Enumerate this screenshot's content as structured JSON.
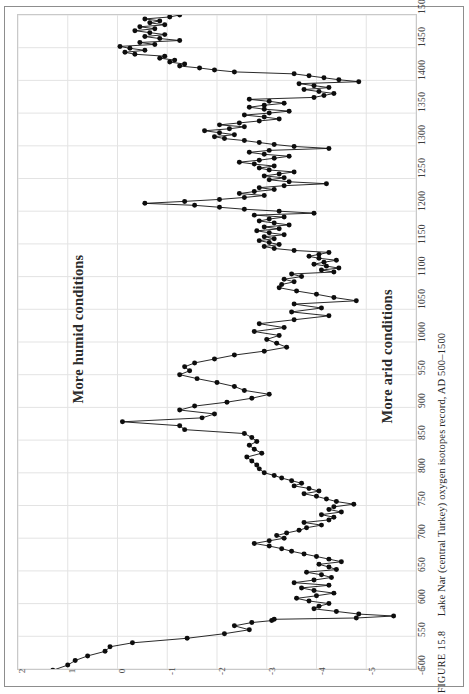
{
  "caption": {
    "number": "FIGURE 15.8",
    "text": "Lake Nar (central Turkey) oxygen isotopes record, AD 500–1500"
  },
  "annotations": {
    "humid": "More humid conditions",
    "arid": "More arid conditions"
  },
  "colors": {
    "line": "#111111",
    "marker": "#0d0d0d",
    "grid": "#e3e3e3",
    "plot_border": "#c9c9c9",
    "plate_border": "#8d8d8d",
    "tick_text": "#3c3c3c",
    "annotation_text": "#2b2b2b",
    "background": "#ffffff"
  },
  "chart_data": {
    "type": "line",
    "orientation": "rotated-90-ccw",
    "title": "Lake Nar (central Turkey) oxygen isotopes record, AD 500–1500",
    "xlabel": "AD",
    "ylabel": "δ18O",
    "grid": true,
    "legend": "none",
    "xlim": [
      500,
      1500
    ],
    "ylim": [
      2,
      -6
    ],
    "xticks": [
      500,
      550,
      600,
      650,
      700,
      750,
      800,
      850,
      900,
      950,
      1000,
      1050,
      1100,
      1150,
      1200,
      1250,
      1300,
      1350,
      1400,
      1450,
      1500
    ],
    "yticks": [
      -6,
      -5,
      -4,
      -3,
      -2,
      -1,
      0,
      1,
      2
    ],
    "ytick_labels": [
      "-6",
      "-5",
      "-4",
      "-3",
      "-2",
      "-1",
      "0",
      "1",
      "2"
    ],
    "annotations": [
      {
        "text": "More humid conditions",
        "near_value": -4.6
      },
      {
        "text": "More arid conditions",
        "near_value": 0.6
      }
    ],
    "series": [
      {
        "name": "Lake Nar δ18O",
        "marker": "filled-circle",
        "x": [
          498,
          506,
          513,
          520,
          527,
          534,
          540,
          547,
          554,
          560,
          566,
          571,
          574,
          576,
          578,
          581,
          584,
          588,
          592,
          596,
          600,
          604,
          608,
          612,
          616,
          620,
          624,
          628,
          632,
          636,
          640,
          644,
          648,
          652,
          656,
          660,
          664,
          668,
          672,
          676,
          680,
          684,
          688,
          692,
          696,
          700,
          704,
          708,
          712,
          716,
          720,
          724,
          728,
          732,
          736,
          740,
          744,
          748,
          752,
          756,
          760,
          764,
          768,
          772,
          776,
          780,
          784,
          788,
          792,
          796,
          800,
          806,
          812,
          818,
          824,
          830,
          836,
          842,
          848,
          854,
          860,
          866,
          872,
          878,
          884,
          890,
          896,
          902,
          908,
          914,
          920,
          926,
          932,
          938,
          944,
          950,
          956,
          962,
          968,
          974,
          980,
          986,
          992,
          998,
          1004,
          1010,
          1016,
          1022,
          1028,
          1034,
          1040,
          1046,
          1052,
          1058,
          1063,
          1068,
          1073,
          1078,
          1083,
          1088,
          1092,
          1096,
          1100,
          1104,
          1107,
          1110,
          1113,
          1116,
          1119,
          1122,
          1125,
          1128,
          1131,
          1134,
          1137,
          1140,
          1143,
          1146,
          1149,
          1152,
          1155,
          1158,
          1161,
          1164,
          1167,
          1170,
          1173,
          1176,
          1179,
          1182,
          1185,
          1188,
          1191,
          1194,
          1197,
          1200,
          1203,
          1206,
          1209,
          1212,
          1215,
          1218,
          1221,
          1224,
          1227,
          1230,
          1233,
          1236,
          1239,
          1242,
          1245,
          1248,
          1251,
          1254,
          1257,
          1260,
          1263,
          1266,
          1269,
          1272,
          1275,
          1278,
          1281,
          1284,
          1287,
          1290,
          1293,
          1296,
          1299,
          1302,
          1305,
          1308,
          1311,
          1314,
          1317,
          1320,
          1323,
          1326,
          1329,
          1332,
          1335,
          1338,
          1341,
          1344,
          1347,
          1350,
          1353,
          1356,
          1359,
          1362,
          1365,
          1368,
          1371,
          1374,
          1377,
          1380,
          1383,
          1386,
          1389,
          1392,
          1395,
          1398,
          1401,
          1404,
          1407,
          1410,
          1413,
          1416,
          1419,
          1422,
          1425,
          1428,
          1431,
          1434,
          1437,
          1440,
          1443,
          1446,
          1449,
          1452,
          1455,
          1458,
          1461,
          1464,
          1467,
          1470,
          1473,
          1476,
          1479,
          1482,
          1485,
          1488,
          1491,
          1494,
          1497,
          1500
        ],
        "y": [
          1.3,
          1.0,
          0.85,
          0.6,
          0.25,
          0.15,
          -0.3,
          -1.4,
          -2.15,
          -2.65,
          -2.35,
          -2.7,
          -3.1,
          -3.15,
          -4.8,
          -5.55,
          -4.85,
          -4.4,
          -3.95,
          -4.05,
          -4.25,
          -3.85,
          -3.6,
          -4.0,
          -4.35,
          -3.95,
          -3.7,
          -4.25,
          -3.55,
          -3.95,
          -4.3,
          -4.1,
          -3.8,
          -4.4,
          -4.25,
          -4.05,
          -4.5,
          -4.25,
          -4.0,
          -3.75,
          -3.5,
          -3.3,
          -3.05,
          -2.75,
          -3.05,
          -3.35,
          -3.2,
          -3.4,
          -3.65,
          -3.8,
          -4.1,
          -3.75,
          -4.25,
          -4.35,
          -4.1,
          -4.5,
          -4.25,
          -4.35,
          -4.75,
          -4.4,
          -4.2,
          -4.0,
          -3.75,
          -4.05,
          -3.85,
          -3.55,
          -3.7,
          -3.5,
          -3.3,
          -3.15,
          -2.95,
          -2.85,
          -2.8,
          -2.7,
          -2.6,
          -2.9,
          -2.75,
          -2.65,
          -2.8,
          -2.7,
          -2.55,
          -1.35,
          -1.25,
          -0.1,
          -1.7,
          -1.95,
          -1.25,
          -1.55,
          -2.2,
          -2.7,
          -3.05,
          -2.55,
          -2.35,
          -2.0,
          -1.6,
          -1.25,
          -1.45,
          -1.35,
          -1.55,
          -1.95,
          -2.35,
          -2.95,
          -3.4,
          -3.2,
          -3.0,
          -3.25,
          -2.75,
          -3.35,
          -2.85,
          -3.55,
          -4.25,
          -3.5,
          -4.1,
          -3.55,
          -4.8,
          -4.35,
          -4.0,
          -3.6,
          -3.25,
          -3.3,
          -3.55,
          -3.35,
          -3.7,
          -3.5,
          -4.35,
          -4.1,
          -4.45,
          -4.2,
          -3.95,
          -4.15,
          -4.4,
          -4.05,
          -3.85,
          -4.05,
          -4.25,
          -3.55,
          -3.15,
          -2.95,
          -3.25,
          -3.05,
          -2.85,
          -3.15,
          -2.95,
          -3.35,
          -3.05,
          -2.8,
          -3.25,
          -2.95,
          -3.45,
          -3.15,
          -2.85,
          -3.05,
          -3.35,
          -2.75,
          -3.95,
          -3.25,
          -2.55,
          -2.05,
          -1.55,
          -0.55,
          -1.35,
          -2.05,
          -2.55,
          -2.95,
          -2.45,
          -2.75,
          -3.15,
          -2.85,
          -3.35,
          -4.2,
          -3.45,
          -3.05,
          -3.35,
          -2.95,
          -3.25,
          -3.55,
          -3.05,
          -2.85,
          -3.15,
          -2.75,
          -2.45,
          -2.85,
          -3.15,
          -3.45,
          -2.95,
          -2.65,
          -3.05,
          -4.25,
          -3.55,
          -3.15,
          -2.85,
          -2.55,
          -2.15,
          -1.95,
          -2.35,
          -2.05,
          -1.75,
          -2.25,
          -2.55,
          -2.05,
          -2.45,
          -2.85,
          -3.25,
          -2.95,
          -2.55,
          -3.05,
          -3.45,
          -2.95,
          -2.65,
          -2.95,
          -3.35,
          -3.05,
          -2.65,
          -3.95,
          -4.15,
          -4.35,
          -4.05,
          -3.75,
          -4.25,
          -3.95,
          -3.65,
          -4.85,
          -4.45,
          -4.15,
          -3.85,
          -3.55,
          -2.35,
          -1.95,
          -1.65,
          -1.25,
          -1.35,
          -1.05,
          -1.15,
          -0.85,
          -0.95,
          -0.35,
          -0.15,
          -0.55,
          -0.25,
          -0.05,
          -0.75,
          -0.45,
          -1.25,
          -0.85,
          -0.55,
          -0.95,
          -0.65,
          -0.35,
          -0.75,
          -0.45,
          -0.95,
          -0.65,
          -0.85,
          -0.55,
          -1.05,
          -1.25
        ]
      }
    ]
  }
}
